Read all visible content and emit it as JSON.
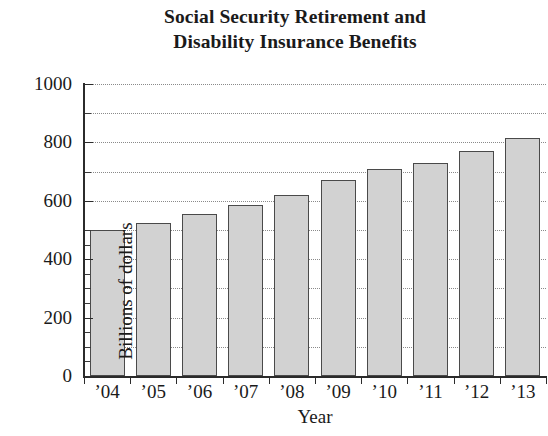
{
  "title": {
    "line1": "Social Security Retirement and",
    "line2": "Disability Insurance Benefits"
  },
  "axes": {
    "ylabel": "Billions of dollars",
    "xlabel": "Year"
  },
  "chart_data": {
    "type": "bar",
    "title": "Social Security Retirement and Disability Insurance Benefits",
    "xlabel": "Year",
    "ylabel": "Billions of dollars",
    "categories": [
      "’04",
      "’05",
      "’06",
      "’07",
      "’08",
      "’09",
      "’10",
      "’11",
      "’12",
      "’13"
    ],
    "values": [
      500,
      525,
      555,
      585,
      620,
      670,
      710,
      730,
      770,
      815
    ],
    "ylim": [
      0,
      1000
    ],
    "ytick_labels": [
      "0",
      "200",
      "400",
      "600",
      "800",
      "1000"
    ],
    "ytick_values": [
      0,
      200,
      400,
      600,
      800,
      1000
    ],
    "yminor_tick_values": [
      100,
      300,
      500,
      700,
      900
    ],
    "gridline_values": [
      100,
      200,
      300,
      400,
      500,
      600,
      700,
      800,
      900,
      1000
    ],
    "grid": "horizontal-dotted",
    "legend": null,
    "bar_fill_color": "#d2d2d2",
    "bar_edge_color": "#4a4a4a",
    "axis_color": "#2b2b2b",
    "grid_color": "#8a8a8a",
    "background_color": "#ffffff"
  }
}
